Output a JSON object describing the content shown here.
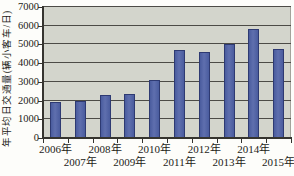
{
  "chart_data": {
    "type": "bar",
    "title": "",
    "xlabel": "",
    "ylabel": "年平均日交通量(辆小客车/日)",
    "categories": [
      "2006年",
      "2007年",
      "2008年",
      "2009年",
      "2010年",
      "2011年",
      "2012年",
      "2013年",
      "2014年",
      "2015年"
    ],
    "values": [
      1900,
      2000,
      2300,
      2330,
      3120,
      4720,
      4580,
      5030,
      5800,
      4770
    ],
    "ylim": [
      0,
      7000
    ],
    "yticks": [
      0,
      1000,
      2000,
      3000,
      4000,
      5000,
      6000,
      7000
    ],
    "grid": true,
    "legend_position": "none",
    "xtick_layout": "staggered-two-rows",
    "colors": {
      "bar_fill": "#4a5c9e",
      "bar_fill_light": "#5f6fae",
      "bar_edge": "#2e3a72",
      "plot_bg": "#d3d5cc",
      "gridline": "#4c4b46",
      "axis": "#35342f",
      "plot_right_edge": "#a3a39b",
      "text": "#1c1c18",
      "page_bg": "#fdfdfa"
    }
  }
}
